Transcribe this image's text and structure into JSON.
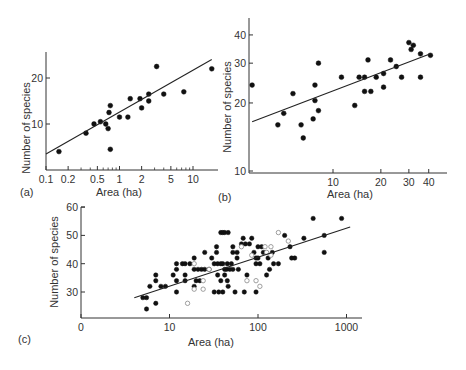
{
  "figure": {
    "panels": [
      {
        "id": "a",
        "label": "(a)",
        "xlabel": "Area (ha)",
        "ylabel": "Number of species"
      },
      {
        "id": "b",
        "label": "(b)",
        "xlabel": "Area (ha)",
        "ylabel": "Number of species"
      },
      {
        "id": "c",
        "label": "(c)",
        "xlabel": "Area (ha)",
        "ylabel": "Number of species"
      }
    ]
  },
  "chart_data": [
    {
      "type": "scatter",
      "title": "(a)",
      "xlabel": "Area (ha)",
      "ylabel": "Number of species",
      "xscale": "log",
      "yscale": "linear",
      "xticks": [
        "0.1",
        "0.2",
        "0.5",
        "1",
        "2",
        "5",
        "10"
      ],
      "yticks": [
        "10",
        "20"
      ],
      "xlim": [
        0.1,
        20
      ],
      "ylim": [
        0,
        25
      ],
      "grid": false,
      "series": [
        {
          "name": "observed",
          "marker": "filled-circle",
          "points": [
            [
              0.15,
              4
            ],
            [
              0.35,
              8
            ],
            [
              0.45,
              10
            ],
            [
              0.55,
              10.5
            ],
            [
              0.65,
              10
            ],
            [
              0.7,
              9
            ],
            [
              0.72,
              12.5
            ],
            [
              0.75,
              14
            ],
            [
              0.75,
              4.5
            ],
            [
              1.0,
              11.5
            ],
            [
              1.3,
              11.5
            ],
            [
              1.4,
              15.5
            ],
            [
              1.9,
              15.5
            ],
            [
              2.0,
              13.5
            ],
            [
              2.5,
              16.5
            ],
            [
              2.5,
              15
            ],
            [
              3.2,
              22.5
            ],
            [
              4.0,
              16.5
            ],
            [
              7.5,
              17
            ],
            [
              18,
              22
            ]
          ]
        },
        {
          "name": "fit",
          "type": "line",
          "points": [
            [
              0.1,
              3.5
            ],
            [
              18,
              24
            ]
          ]
        }
      ]
    },
    {
      "type": "scatter",
      "title": "(b)",
      "xlabel": "Area (ha)",
      "ylabel": "Number of species",
      "xscale": "log",
      "yscale": "log",
      "xticks": [
        "10",
        "20",
        "30",
        "40"
      ],
      "yticks": [
        "10",
        "20",
        "30",
        "40"
      ],
      "xlim": [
        3,
        45
      ],
      "ylim": [
        10,
        45
      ],
      "grid": false,
      "series": [
        {
          "name": "observed",
          "marker": "filled-circle",
          "points": [
            [
              3.1,
              24
            ],
            [
              4.5,
              16
            ],
            [
              4.9,
              18
            ],
            [
              5.6,
              22
            ],
            [
              6.3,
              16
            ],
            [
              6.5,
              14
            ],
            [
              7.5,
              17
            ],
            [
              7.7,
              24
            ],
            [
              7.7,
              20.5
            ],
            [
              8.1,
              18.5
            ],
            [
              8.1,
              30
            ],
            [
              11.3,
              26
            ],
            [
              13.7,
              19.5
            ],
            [
              14.6,
              26
            ],
            [
              15.8,
              26
            ],
            [
              15.8,
              22.5
            ],
            [
              16.6,
              31
            ],
            [
              17.3,
              22.5
            ],
            [
              18.7,
              26
            ],
            [
              20.8,
              27
            ],
            [
              20.8,
              23.5
            ],
            [
              23,
              31
            ],
            [
              25,
              29
            ],
            [
              27,
              26
            ],
            [
              30,
              37
            ],
            [
              31,
              34.5
            ],
            [
              32,
              36
            ],
            [
              35.5,
              33
            ],
            [
              35.5,
              26
            ],
            [
              41,
              32.5
            ]
          ]
        },
        {
          "name": "fit",
          "type": "line",
          "points": [
            [
              3.1,
              16.5
            ],
            [
              41,
              33
            ]
          ]
        }
      ]
    },
    {
      "type": "scatter",
      "title": "(c)",
      "xlabel": "Area (ha)",
      "ylabel": "Number of species",
      "xscale": "log",
      "yscale": "linear",
      "xticks": [
        "0",
        "10",
        "100",
        "1000"
      ],
      "yticks": [
        "30",
        "40",
        "50",
        "60"
      ],
      "xlim": [
        1,
        1300
      ],
      "ylim": [
        20,
        60
      ],
      "grid": false,
      "series": [
        {
          "name": "filled",
          "marker": "filled-circle",
          "points": [
            [
              5,
              28
            ],
            [
              5.5,
              28
            ],
            [
              5.5,
              24
            ],
            [
              6,
              32
            ],
            [
              7,
              36
            ],
            [
              7,
              34
            ],
            [
              7,
              26
            ],
            [
              8,
              32
            ],
            [
              9,
              32
            ],
            [
              11,
              36
            ],
            [
              12,
              40
            ],
            [
              12,
              38
            ],
            [
              12,
              34
            ],
            [
              12,
              30
            ],
            [
              14,
              40
            ],
            [
              15,
              40
            ],
            [
              15,
              36
            ],
            [
              15,
              34
            ],
            [
              17,
              40
            ],
            [
              19,
              42
            ],
            [
              19,
              38
            ],
            [
              19,
              32
            ],
            [
              20,
              34
            ],
            [
              21,
              38
            ],
            [
              22,
              34
            ],
            [
              23,
              38
            ],
            [
              25,
              44
            ],
            [
              25,
              38
            ],
            [
              28,
              38
            ],
            [
              30,
              42
            ],
            [
              32,
              40
            ],
            [
              32,
              30
            ],
            [
              34,
              46
            ],
            [
              34,
              44
            ],
            [
              35,
              40
            ],
            [
              35,
              36
            ],
            [
              36,
              30
            ],
            [
              38,
              51
            ],
            [
              38,
              40
            ],
            [
              38,
              34
            ],
            [
              40,
              51
            ],
            [
              40,
              40
            ],
            [
              40,
              30
            ],
            [
              42,
              51
            ],
            [
              42,
              38
            ],
            [
              42,
              36
            ],
            [
              44,
              38
            ],
            [
              45,
              40
            ],
            [
              45,
              34
            ],
            [
              46,
              32
            ],
            [
              46,
              51
            ],
            [
              48,
              38
            ],
            [
              50,
              40
            ],
            [
              52,
              46
            ],
            [
              52,
              44
            ],
            [
              52,
              38
            ],
            [
              55,
              30
            ],
            [
              58,
              44
            ],
            [
              58,
              42
            ],
            [
              60,
              38
            ],
            [
              65,
              47
            ],
            [
              68,
              49
            ],
            [
              70,
              30
            ],
            [
              72,
              47
            ],
            [
              75,
              36
            ],
            [
              80,
              47
            ],
            [
              85,
              49
            ],
            [
              90,
              44
            ],
            [
              95,
              42
            ],
            [
              95,
              40
            ],
            [
              95,
              30
            ],
            [
              100,
              46
            ],
            [
              100,
              42
            ],
            [
              105,
              40
            ],
            [
              110,
              46
            ],
            [
              115,
              44
            ],
            [
              125,
              36
            ],
            [
              130,
              42
            ],
            [
              135,
              38
            ],
            [
              145,
              44
            ],
            [
              150,
              40
            ],
            [
              170,
              40
            ],
            [
              200,
              50
            ],
            [
              230,
              46
            ],
            [
              240,
              42
            ],
            [
              260,
              42
            ],
            [
              330,
              49
            ],
            [
              420,
              56
            ],
            [
              560,
              50
            ],
            [
              560,
              44
            ],
            [
              880,
              56
            ]
          ]
        },
        {
          "name": "open",
          "marker": "open-circle",
          "points": [
            [
              16,
              26
            ],
            [
              19,
              40
            ],
            [
              19,
              31
            ],
            [
              24,
              34
            ],
            [
              24,
              31
            ],
            [
              28,
              38
            ],
            [
              65,
              46
            ],
            [
              75,
              34
            ],
            [
              85,
              43
            ],
            [
              95,
              34
            ],
            [
              105,
              32
            ],
            [
              120,
              46
            ],
            [
              125,
              44
            ],
            [
              140,
              46
            ],
            [
              140,
              43
            ],
            [
              170,
              51
            ],
            [
              220,
              48
            ]
          ]
        },
        {
          "name": "fit",
          "type": "line",
          "points": [
            [
              4,
              28
            ],
            [
              1100,
              53
            ]
          ]
        }
      ]
    }
  ]
}
